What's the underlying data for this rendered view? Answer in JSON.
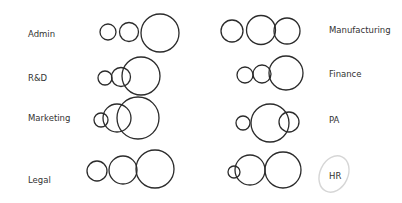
{
  "diagram": {
    "stroke_color": "#2b2b2b",
    "highlight_stroke_color": "#d6d6d6",
    "groups": [
      {
        "label": "Admin",
        "label_pos": [
          28,
          29
        ],
        "circles": [
          [
            108,
            32,
            8
          ],
          [
            129,
            32,
            9.5
          ],
          [
            160,
            33,
            19
          ]
        ]
      },
      {
        "label": "R&D",
        "label_pos": [
          28,
          73
        ],
        "circles": [
          [
            105,
            78,
            7
          ],
          [
            121,
            77,
            9.5
          ],
          [
            141,
            76,
            19
          ]
        ]
      },
      {
        "label": "Marketing",
        "label_pos": [
          28,
          113
        ],
        "circles": [
          [
            101,
            120,
            7
          ],
          [
            117,
            118,
            14
          ],
          [
            138,
            118,
            21
          ]
        ]
      },
      {
        "label": "Legal",
        "label_pos": [
          28,
          175
        ],
        "circles": [
          [
            97,
            171,
            10
          ],
          [
            123,
            170,
            14
          ],
          [
            155,
            169,
            19
          ]
        ]
      },
      {
        "label": "Manufacturing",
        "label_pos": [
          329,
          25
        ],
        "circles": [
          [
            232,
            31,
            11
          ],
          [
            261,
            30,
            14.5
          ],
          [
            287,
            31,
            13
          ]
        ]
      },
      {
        "label": "Finance",
        "label_pos": [
          329,
          69
        ],
        "circles": [
          [
            245,
            75,
            8
          ],
          [
            262,
            74,
            9
          ],
          [
            286,
            73,
            17
          ]
        ]
      },
      {
        "label": "PA",
        "label_pos": [
          329,
          115
        ],
        "circles": [
          [
            243,
            123,
            7
          ],
          [
            270,
            123,
            19
          ],
          [
            289,
            122,
            10
          ]
        ]
      },
      {
        "label": "HR",
        "label_pos": [
          329,
          171
        ],
        "circles": [
          [
            234,
            172,
            6
          ],
          [
            250,
            170,
            15
          ],
          [
            283,
            170,
            18
          ]
        ],
        "highlighted": true
      }
    ]
  }
}
